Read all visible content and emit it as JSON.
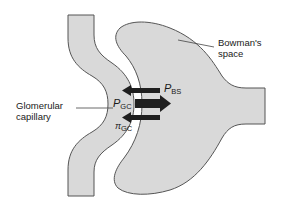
{
  "diagram": {
    "colors": {
      "fill": "#d9d9d9",
      "stroke": "#555555",
      "arrow": "#1f1f1f",
      "background": "#ffffff"
    },
    "labels": {
      "bowmans_space_line1": "Bowman's",
      "bowmans_space_line2": "space",
      "glomerular_capillary_line1": "Glomerular",
      "glomerular_capillary_line2": "capillary"
    },
    "symbols": {
      "p_gc": {
        "main": "P",
        "sub": "GC"
      },
      "p_bs": {
        "main": "P",
        "sub": "BS"
      },
      "pi_gc": {
        "main": "π",
        "sub": "GC"
      }
    },
    "arrows": [
      {
        "name": "p-bs-arrow",
        "direction": "left",
        "label": "PBS"
      },
      {
        "name": "p-gc-arrow",
        "direction": "right",
        "label": "PGC"
      },
      {
        "name": "pi-gc-arrow",
        "direction": "left",
        "label": "πGC"
      }
    ]
  }
}
